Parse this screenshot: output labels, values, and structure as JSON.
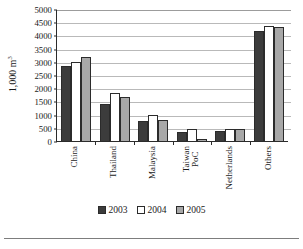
{
  "chart_data": {
    "type": "bar",
    "title": "",
    "xlabel": "",
    "ylabel": "1,000 m3",
    "ylabel_prefix": "1,000 m",
    "ylabel_superscript": "3",
    "ylim": [
      0,
      5000
    ],
    "ytick_step": 500,
    "yticks": [
      "5000",
      "4500",
      "4000",
      "3500",
      "3000",
      "2500",
      "2000",
      "1500",
      "1000",
      "500",
      "0"
    ],
    "grid": true,
    "legend_position": "bottom-center",
    "categories": [
      "China",
      "Thailand",
      "Malaysia",
      "Taiwan PoC",
      "Netherlands",
      "Others"
    ],
    "category_lines": [
      [
        "China"
      ],
      [
        "Thailand"
      ],
      [
        "Malaysia"
      ],
      [
        "Taiwan",
        "PoC"
      ],
      [
        "Netherlands"
      ],
      [
        "Others"
      ]
    ],
    "series": [
      {
        "name": "2003",
        "color": "#3c3c3c",
        "values": [
          2850,
          1420,
          740,
          330,
          380,
          4180
        ]
      },
      {
        "name": "2004",
        "color": "#ffffff",
        "values": [
          2980,
          1820,
          1000,
          450,
          450,
          4370
        ]
      },
      {
        "name": "2005",
        "color": "#a8a8a8",
        "values": [
          3200,
          1680,
          800,
          60,
          470,
          4300
        ]
      }
    ]
  },
  "legend": {
    "items": [
      {
        "label": "2003"
      },
      {
        "label": "2004"
      },
      {
        "label": "2005"
      }
    ]
  },
  "footer": {
    "caption": ""
  }
}
